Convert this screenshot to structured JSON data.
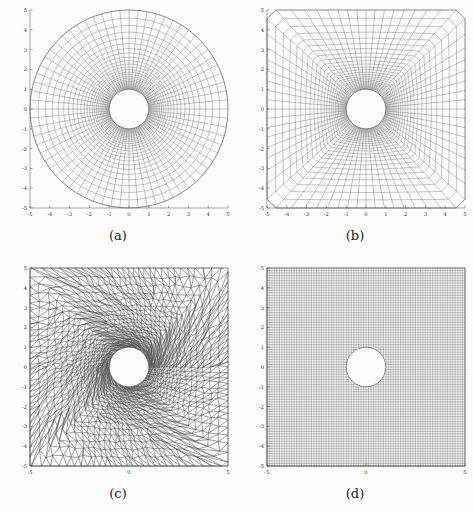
{
  "figure": {
    "background_color": "#fdfdfd",
    "mesh_color": "#4a4a4a",
    "axis_color": "#4d4d4d",
    "hole_fill_color": "#fcfcfc"
  },
  "panels": [
    {
      "id": "a",
      "caption": "(a)",
      "mesh_type": "polar-o-grid",
      "description": "Structured polar (O-type) mesh around a circular hole, circular outer boundary",
      "outer_shape": "circle",
      "inner_radius": 1,
      "outer_radius": 5,
      "n_angular": 68,
      "n_radial": 26,
      "radial_grading": 1.105,
      "xaxis": {
        "min": -5,
        "max": 5,
        "ticks": [
          -5,
          -4,
          -3,
          -2,
          -1,
          0,
          1,
          2,
          3,
          4,
          5
        ],
        "ticklabels": [
          "-5",
          "-4",
          "-3",
          "-2",
          "-1",
          "0",
          "1",
          "2",
          "3",
          "4",
          "5"
        ]
      },
      "yaxis": {
        "min": -5,
        "max": 5,
        "ticks": [
          -5,
          -4,
          -3,
          -2,
          -1,
          0,
          1,
          2,
          3,
          4,
          5
        ],
        "ticklabels": [
          "-5",
          "-4",
          "-3",
          "-2",
          "-1",
          "0",
          "1",
          "2",
          "3",
          "4",
          "5"
        ]
      }
    },
    {
      "id": "b",
      "caption": "(b)",
      "mesh_type": "square-o-grid",
      "description": "Structured O-type mesh, circular inner boundary blended to a square outer boundary",
      "outer_shape": "square",
      "inner_radius": 1,
      "outer_half_width": 5,
      "n_angular": 68,
      "n_radial": 26,
      "radial_grading": 1.105,
      "xaxis": {
        "min": -5,
        "max": 5,
        "ticks": [
          -5,
          -4,
          -3,
          -2,
          -1,
          0,
          1,
          2,
          3,
          4,
          5
        ],
        "ticklabels": [
          "-5",
          "-4",
          "-3",
          "-2",
          "-1",
          "0",
          "1",
          "2",
          "3",
          "4",
          "5"
        ]
      },
      "yaxis": {
        "min": -5,
        "max": 5,
        "ticks": [
          -5,
          -4,
          -3,
          -2,
          -1,
          0,
          1,
          2,
          3,
          4,
          5
        ],
        "ticklabels": [
          "-5",
          "-4",
          "-3",
          "-2",
          "-1",
          "0",
          "1",
          "2",
          "3",
          "4",
          "5"
        ]
      }
    },
    {
      "id": "c",
      "caption": "(c)",
      "mesh_type": "unstructured-triangular",
      "description": "Unstructured triangular mesh, refined toward the circular hole, square outer boundary",
      "outer_shape": "square",
      "inner_radius": 1,
      "outer_half_width": 5,
      "n_boundary_circle": 56,
      "n_rings": 22,
      "ring_grading": 1.118,
      "xaxis": {
        "min": -5,
        "max": 5,
        "ticks": [
          -5,
          0,
          5
        ],
        "ticklabels": [
          "-5",
          "0",
          "5"
        ]
      },
      "yaxis": {
        "min": -5,
        "max": 5,
        "ticks": [
          -5,
          -4,
          -3,
          -2,
          -1,
          0,
          1,
          2,
          3,
          4,
          5
        ],
        "ticklabels": [
          "-5",
          "-4",
          "-3",
          "-2",
          "-1",
          "0",
          "1",
          "2",
          "3",
          "4",
          "5"
        ]
      }
    },
    {
      "id": "d",
      "caption": "(d)",
      "mesh_type": "cartesian-cut-cell",
      "description": "Uniform Cartesian grid with a circular hole cut out of the cells",
      "outer_shape": "square",
      "inner_radius": 1,
      "outer_half_width": 5,
      "cells_per_side": 80,
      "xaxis": {
        "min": -5,
        "max": 5,
        "ticks": [
          -5,
          0,
          5
        ],
        "ticklabels": [
          "-5",
          "0",
          "5"
        ]
      },
      "yaxis": {
        "min": -5,
        "max": 5,
        "ticks": [
          -5,
          -4,
          -3,
          -2,
          -1,
          0,
          1,
          2,
          3,
          4,
          5
        ],
        "ticklabels": [
          "-5",
          "-4",
          "-3",
          "-2",
          "-1",
          "0",
          "1",
          "2",
          "3",
          "4",
          "5"
        ]
      }
    }
  ]
}
